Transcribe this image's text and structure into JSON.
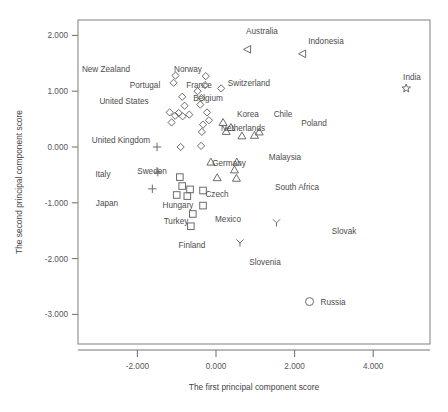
{
  "chart_data": {
    "type": "scatter",
    "title": "",
    "xlabel": "The first principal component score",
    "ylabel": "The second principal component score",
    "xlim": [
      -3.5,
      5.45
    ],
    "ylim": [
      -3.45,
      2.35
    ],
    "xticks": [
      "-2.000",
      "0.000",
      "2.000",
      "4.000"
    ],
    "xtickvalues": [
      -2.0,
      0.0,
      2.0,
      4.0
    ],
    "yticks": [
      "2.000",
      "1.000",
      "0.000",
      "-1.000",
      "-2.000",
      "-3.000"
    ],
    "ytickvalues": [
      2.0,
      1.0,
      0.0,
      -1.0,
      -2.0,
      -3.0
    ],
    "grid": false,
    "legend": "none",
    "marker_shapes": {
      "diamond": "open diamond",
      "square": "open square",
      "triangle-up": "open up triangle",
      "triangle-left": "open left-pointing triangle",
      "plus": "plus cross",
      "y-marker": "y shaped marker",
      "star": "open star",
      "circle": "open circle"
    },
    "points": [
      {
        "label": "New Zealand",
        "shape": "diamond",
        "x": -1.03,
        "y": 1.28,
        "lx": 106,
        "ly": 72,
        "anchor": "middle"
      },
      {
        "label": "Norway",
        "shape": "diamond",
        "x": -0.26,
        "y": 1.27,
        "lx": 188,
        "ly": 72,
        "anchor": "middle"
      },
      {
        "label": "Switzerland",
        "shape": "diamond",
        "x": 0.13,
        "y": 1.05,
        "lx": 249,
        "ly": 86,
        "anchor": "middle"
      },
      {
        "label": "Portugal",
        "shape": "diamond",
        "x": -0.86,
        "y": 0.9,
        "lx": 145,
        "ly": 88,
        "anchor": "middle"
      },
      {
        "label": "France",
        "shape": "diamond",
        "x": -0.47,
        "y": 1.0,
        "lx": 199,
        "ly": 88,
        "anchor": "middle"
      },
      {
        "label": "Belgium",
        "shape": "diamond",
        "x": -0.4,
        "y": 0.76,
        "lx": 208,
        "ly": 101,
        "anchor": "middle"
      },
      {
        "label": "United States",
        "shape": "diamond",
        "x": -1.18,
        "y": 0.62,
        "lx": 124,
        "ly": 104,
        "anchor": "middle"
      },
      {
        "label": "Netherlands",
        "shape": "diamond",
        "x": -0.18,
        "y": 0.48,
        "lx": 243,
        "ly": 131,
        "anchor": "middle"
      },
      {
        "label": "United Kingdom",
        "shape": "plus",
        "x": -1.5,
        "y": 0.0,
        "lx": 121,
        "ly": 143,
        "anchor": "middle"
      },
      {
        "label": "Italy",
        "shape": "plus",
        "x": -1.48,
        "y": -0.45,
        "lx": 103,
        "ly": 177,
        "anchor": "middle"
      },
      {
        "label": "Japan",
        "shape": "plus",
        "x": -1.62,
        "y": -0.75,
        "lx": 107,
        "ly": 206,
        "anchor": "middle"
      },
      {
        "label": "Sweden",
        "shape": "square",
        "x": -0.92,
        "y": -0.54,
        "lx": 152,
        "ly": 174,
        "anchor": "middle"
      },
      {
        "label": "Germany",
        "shape": "triangle-up",
        "x": -0.13,
        "y": -0.27,
        "lx": 229,
        "ly": 166,
        "anchor": "middle"
      },
      {
        "label": "Malaysia",
        "shape": "triangle-up",
        "x": 0.53,
        "y": -0.27,
        "lx": 285,
        "ly": 160,
        "anchor": "middle"
      },
      {
        "label": "South Africa",
        "shape": "triangle-up",
        "x": 0.52,
        "y": -0.56,
        "lx": 297,
        "ly": 190,
        "anchor": "middle"
      },
      {
        "label": "Czech",
        "shape": "square",
        "x": -0.33,
        "y": -0.78,
        "lx": 217,
        "ly": 197,
        "anchor": "middle"
      },
      {
        "label": "Hungary",
        "shape": "square",
        "x": -0.73,
        "y": -0.88,
        "lx": 178,
        "ly": 208,
        "anchor": "middle"
      },
      {
        "label": "Turkey",
        "shape": "square",
        "x": -0.59,
        "y": -1.2,
        "lx": 176,
        "ly": 224,
        "anchor": "middle"
      },
      {
        "label": "Mexico",
        "shape": "square",
        "x": -0.33,
        "y": -1.05,
        "lx": 228,
        "ly": 222,
        "anchor": "middle"
      },
      {
        "label": "Finland",
        "shape": "square",
        "x": -0.64,
        "y": -1.42,
        "lx": 192,
        "ly": 248,
        "anchor": "middle"
      },
      {
        "label": "Korea",
        "shape": "triangle-up",
        "x": 0.18,
        "y": 0.44,
        "lx": 248,
        "ly": 117,
        "anchor": "middle"
      },
      {
        "label": "Chile",
        "shape": "triangle-up",
        "x": 0.38,
        "y": 0.35,
        "lx": 283,
        "ly": 117,
        "anchor": "middle"
      },
      {
        "label": "Poland",
        "shape": "triangle-up",
        "x": 1.1,
        "y": 0.27,
        "lx": 314,
        "ly": 126,
        "anchor": "middle"
      },
      {
        "label": "Australia",
        "shape": "triangle-left",
        "x": 0.8,
        "y": 1.75,
        "lx": 262,
        "ly": 34,
        "anchor": "middle"
      },
      {
        "label": "Indonesia",
        "shape": "triangle-left",
        "x": 2.2,
        "y": 1.67,
        "lx": 326,
        "ly": 44,
        "anchor": "middle"
      },
      {
        "label": "India",
        "shape": "star",
        "x": 4.84,
        "y": 1.05,
        "lx": 412,
        "ly": 80,
        "anchor": "middle"
      },
      {
        "label": "Slovak",
        "shape": "y-marker",
        "x": 1.54,
        "y": -1.36,
        "lx": 344,
        "ly": 234,
        "anchor": "middle"
      },
      {
        "label": "Slovenia",
        "shape": "y-marker",
        "x": 0.61,
        "y": -1.72,
        "lx": 265,
        "ly": 265,
        "anchor": "middle"
      },
      {
        "label": "Russia",
        "shape": "circle",
        "x": 2.38,
        "y": -2.77,
        "lx": 333,
        "ly": 305,
        "anchor": "middle"
      }
    ],
    "unlabeled_points": [
      {
        "shape": "diamond",
        "x": -1.08,
        "y": 1.15
      },
      {
        "shape": "diamond",
        "x": -0.28,
        "y": 1.11
      },
      {
        "shape": "diamond",
        "x": -0.37,
        "y": 0.88
      },
      {
        "shape": "diamond",
        "x": -0.8,
        "y": 0.74
      },
      {
        "shape": "diamond",
        "x": -0.95,
        "y": 0.61
      },
      {
        "shape": "diamond",
        "x": -1.04,
        "y": 0.56
      },
      {
        "shape": "diamond",
        "x": -0.85,
        "y": 0.55
      },
      {
        "shape": "diamond",
        "x": -0.68,
        "y": 0.58
      },
      {
        "shape": "diamond",
        "x": -1.13,
        "y": 0.44
      },
      {
        "shape": "diamond",
        "x": -0.23,
        "y": 0.62
      },
      {
        "shape": "diamond",
        "x": -0.33,
        "y": 0.4
      },
      {
        "shape": "diamond",
        "x": -0.36,
        "y": 0.27
      },
      {
        "shape": "diamond",
        "x": -0.9,
        "y": 0.0
      },
      {
        "shape": "diamond",
        "x": -0.38,
        "y": 0.02
      },
      {
        "shape": "square",
        "x": -0.86,
        "y": -0.7
      },
      {
        "shape": "square",
        "x": -0.66,
        "y": -0.76
      },
      {
        "shape": "square",
        "x": -1.0,
        "y": -0.86
      },
      {
        "shape": "triangle-up",
        "x": 0.26,
        "y": 0.28
      },
      {
        "shape": "triangle-up",
        "x": 0.66,
        "y": 0.2
      },
      {
        "shape": "triangle-up",
        "x": 0.98,
        "y": 0.21
      },
      {
        "shape": "triangle-up",
        "x": 0.47,
        "y": -0.41
      },
      {
        "shape": "triangle-up",
        "x": 0.03,
        "y": -0.55
      }
    ]
  },
  "axes_geometry": {
    "plot_left": 78,
    "plot_right": 430,
    "plot_top": 20,
    "plot_bottom": 344,
    "x_origin_px": 216,
    "x_unit_px": 39.3,
    "y_origin_px": 147,
    "y_unit_px": 55.8
  }
}
